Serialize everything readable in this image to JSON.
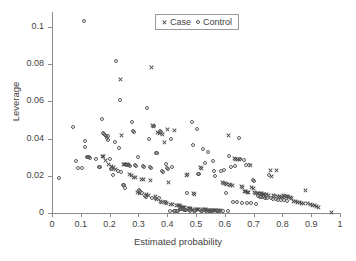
{
  "chart_data": {
    "type": "scatter",
    "title": "",
    "xlabel": "Estimated probability",
    "ylabel": "Leverage",
    "xlim": [
      0,
      1
    ],
    "ylim": [
      0,
      0.108
    ],
    "grid": false,
    "legend_position": "top-center",
    "xticks": [
      0,
      0.1,
      0.2,
      0.3,
      0.4,
      0.5,
      0.6,
      0.7,
      0.8,
      0.9,
      1
    ],
    "xticklabels": [
      "0",
      "0.1",
      "0.2",
      "0.3",
      "0.4",
      "0.5",
      "0.6",
      "0.7",
      "0.8",
      "0.9",
      "1"
    ],
    "yticks": [
      0,
      0.02,
      0.04,
      0.06,
      0.08,
      0.1
    ],
    "yticklabels": [
      "0",
      "0.02",
      "0.04",
      "0.06",
      "0.08",
      "0.1"
    ],
    "series": [
      {
        "name": "Case",
        "marker": "x",
        "color": "#4a4a4a",
        "points": [
          [
            0.175,
            0.0305
          ],
          [
            0.178,
            0.0302
          ],
          [
            0.186,
            0.0283
          ],
          [
            0.196,
            0.0263
          ],
          [
            0.205,
            0.025
          ],
          [
            0.213,
            0.0243
          ],
          [
            0.222,
            0.0233
          ],
          [
            0.238,
            0.072
          ],
          [
            0.24,
            0.0418
          ],
          [
            0.247,
            0.0262
          ],
          [
            0.252,
            0.026
          ],
          [
            0.258,
            0.0258
          ],
          [
            0.262,
            0.0258
          ],
          [
            0.268,
            0.0207
          ],
          [
            0.276,
            0.02
          ],
          [
            0.283,
            0.0193
          ],
          [
            0.289,
            0.019
          ],
          [
            0.296,
            0.011
          ],
          [
            0.303,
            0.0104
          ],
          [
            0.311,
            0.0182
          ],
          [
            0.318,
            0.0178
          ],
          [
            0.327,
            0.0102
          ],
          [
            0.334,
            0.0095
          ],
          [
            0.341,
            0.0175
          ],
          [
            0.345,
            0.0781
          ],
          [
            0.349,
            0.047
          ],
          [
            0.352,
            0.0466
          ],
          [
            0.358,
            0.0088
          ],
          [
            0.363,
            0.007
          ],
          [
            0.368,
            0.0432
          ],
          [
            0.372,
            0.0427
          ],
          [
            0.376,
            0.0064
          ],
          [
            0.381,
            0.0058
          ],
          [
            0.385,
            0.042
          ],
          [
            0.39,
            0.038
          ],
          [
            0.395,
            0.0054
          ],
          [
            0.398,
            0.005
          ],
          [
            0.402,
            0.0451
          ],
          [
            0.405,
            0.0164
          ],
          [
            0.412,
            0.0048
          ],
          [
            0.418,
            0.0045
          ],
          [
            0.424,
            0.0443
          ],
          [
            0.432,
            0.0042
          ],
          [
            0.438,
            0.004
          ],
          [
            0.443,
            0.0038
          ],
          [
            0.447,
            0.0035
          ],
          [
            0.452,
            0.0032
          ],
          [
            0.456,
            0.003
          ],
          [
            0.461,
            0.0028
          ],
          [
            0.466,
            0.0203
          ],
          [
            0.47,
            0.0205
          ],
          [
            0.474,
            0.0026
          ],
          [
            0.478,
            0.0024
          ],
          [
            0.482,
            0.0022
          ],
          [
            0.487,
            0.0021
          ],
          [
            0.492,
            0.0103
          ],
          [
            0.496,
            0.0098
          ],
          [
            0.501,
            0.002
          ],
          [
            0.505,
            0.0019
          ],
          [
            0.51,
            0.0018
          ],
          [
            0.515,
            0.0245
          ],
          [
            0.52,
            0.024
          ],
          [
            0.524,
            0.0018
          ],
          [
            0.529,
            0.0017
          ],
          [
            0.534,
            0.0017
          ],
          [
            0.538,
            0.0016
          ],
          [
            0.542,
            0.0016
          ],
          [
            0.547,
            0.0015
          ],
          [
            0.551,
            0.0015
          ],
          [
            0.555,
            0.0014
          ],
          [
            0.559,
            0.0014
          ],
          [
            0.563,
            0.0014
          ],
          [
            0.567,
            0.0013
          ],
          [
            0.572,
            0.0013
          ],
          [
            0.578,
            0.0013
          ],
          [
            0.585,
            0.0012
          ],
          [
            0.592,
            0.0165
          ],
          [
            0.597,
            0.016
          ],
          [
            0.602,
            0.0157
          ],
          [
            0.607,
            0.0155
          ],
          [
            0.612,
            0.0418
          ],
          [
            0.616,
            0.0152
          ],
          [
            0.621,
            0.015
          ],
          [
            0.626,
            0.0148
          ],
          [
            0.632,
            0.0295
          ],
          [
            0.638,
            0.029
          ],
          [
            0.644,
            0.0288
          ],
          [
            0.651,
            0.0285
          ],
          [
            0.657,
            0.014
          ],
          [
            0.663,
            0.0138
          ],
          [
            0.668,
            0.0115
          ],
          [
            0.673,
            0.0113
          ],
          [
            0.678,
            0.0112
          ],
          [
            0.683,
            0.011
          ],
          [
            0.688,
            0.0255
          ],
          [
            0.693,
            0.0135
          ],
          [
            0.698,
            0.0132
          ],
          [
            0.703,
            0.0108
          ],
          [
            0.708,
            0.0107
          ],
          [
            0.713,
            0.0106
          ],
          [
            0.718,
            0.0105
          ],
          [
            0.723,
            0.0104
          ],
          [
            0.728,
            0.0103
          ],
          [
            0.733,
            0.0102
          ],
          [
            0.738,
            0.01
          ],
          [
            0.744,
            0.0098
          ],
          [
            0.752,
            0.0095
          ],
          [
            0.758,
            0.023
          ],
          [
            0.763,
            0.0195
          ],
          [
            0.768,
            0.0092
          ],
          [
            0.774,
            0.009
          ],
          [
            0.779,
            0.023
          ],
          [
            0.784,
            0.0088
          ],
          [
            0.789,
            0.0086
          ],
          [
            0.794,
            0.0084
          ],
          [
            0.799,
            0.0082
          ],
          [
            0.804,
            0.0092
          ],
          [
            0.809,
            0.009
          ],
          [
            0.814,
            0.0088
          ],
          [
            0.818,
            0.0086
          ],
          [
            0.822,
            0.0084
          ],
          [
            0.827,
            0.0082
          ],
          [
            0.831,
            0.008
          ],
          [
            0.838,
            0.0062
          ],
          [
            0.844,
            0.006
          ],
          [
            0.851,
            0.0058
          ],
          [
            0.858,
            0.0055
          ],
          [
            0.866,
            0.0053
          ],
          [
            0.873,
            0.0052
          ],
          [
            0.88,
            0.012
          ],
          [
            0.888,
            0.005
          ],
          [
            0.896,
            0.0048
          ],
          [
            0.903,
            0.004
          ],
          [
            0.911,
            0.0038
          ],
          [
            0.918,
            0.0034
          ],
          [
            0.925,
            0.003
          ],
          [
            0.972,
            0.0005
          ]
        ]
      },
      {
        "name": "Control",
        "marker": "o",
        "color": "#5a5a5a",
        "points": [
          [
            0.025,
            0.0188
          ],
          [
            0.072,
            0.046
          ],
          [
            0.083,
            0.028
          ],
          [
            0.091,
            0.0243
          ],
          [
            0.105,
            0.024
          ],
          [
            0.11,
            0.103
          ],
          [
            0.113,
            0.0385
          ],
          [
            0.116,
            0.0355
          ],
          [
            0.121,
            0.0302
          ],
          [
            0.124,
            0.03
          ],
          [
            0.128,
            0.0302
          ],
          [
            0.133,
            0.0296
          ],
          [
            0.152,
            0.0288
          ],
          [
            0.163,
            0.0248
          ],
          [
            0.168,
            0.0245
          ],
          [
            0.172,
            0.0504
          ],
          [
            0.176,
            0.0432
          ],
          [
            0.18,
            0.0425
          ],
          [
            0.183,
            0.0418
          ],
          [
            0.186,
            0.0415
          ],
          [
            0.19,
            0.0405
          ],
          [
            0.193,
            0.0412
          ],
          [
            0.196,
            0.0393
          ],
          [
            0.2,
            0.029
          ],
          [
            0.204,
            0.0239
          ],
          [
            0.209,
            0.0236
          ],
          [
            0.213,
            0.0203
          ],
          [
            0.218,
            0.0382
          ],
          [
            0.223,
            0.0815
          ],
          [
            0.228,
            0.0228
          ],
          [
            0.232,
            0.035
          ],
          [
            0.237,
            0.0605
          ],
          [
            0.241,
            0.0222
          ],
          [
            0.246,
            0.0153
          ],
          [
            0.25,
            0.0148
          ],
          [
            0.255,
            0.0135
          ],
          [
            0.259,
            0.026
          ],
          [
            0.264,
            0.0258
          ],
          [
            0.268,
            0.0256
          ],
          [
            0.272,
            0.0254
          ],
          [
            0.277,
            0.0487
          ],
          [
            0.281,
            0.044
          ],
          [
            0.285,
            0.0435
          ],
          [
            0.289,
            0.0256
          ],
          [
            0.293,
            0.0254
          ],
          [
            0.297,
            0.0303
          ],
          [
            0.302,
            0.0125
          ],
          [
            0.306,
            0.012
          ],
          [
            0.311,
            0.011
          ],
          [
            0.315,
            0.025
          ],
          [
            0.319,
            0.0248
          ],
          [
            0.323,
            0.009
          ],
          [
            0.327,
            0.0086
          ],
          [
            0.331,
            0.0563
          ],
          [
            0.336,
            0.0395
          ],
          [
            0.34,
            0.0245
          ],
          [
            0.344,
            0.024
          ],
          [
            0.348,
            0.0082
          ],
          [
            0.353,
            0.0468
          ],
          [
            0.357,
            0.008
          ],
          [
            0.361,
            0.0325
          ],
          [
            0.366,
            0.0322
          ],
          [
            0.37,
            0.0078
          ],
          [
            0.374,
            0.044
          ],
          [
            0.378,
            0.0435
          ],
          [
            0.383,
            0.0225
          ],
          [
            0.387,
            0.0222
          ],
          [
            0.391,
            0.006
          ],
          [
            0.396,
            0.0262
          ],
          [
            0.4,
            0.024
          ],
          [
            0.404,
            0.0238
          ],
          [
            0.409,
            0.0013
          ],
          [
            0.413,
            0.04
          ],
          [
            0.418,
            0.0245
          ],
          [
            0.422,
            0.0012
          ],
          [
            0.428,
            0.0011
          ],
          [
            0.433,
            0.001
          ],
          [
            0.438,
            0.001
          ],
          [
            0.443,
            0.0022
          ],
          [
            0.448,
            0.002
          ],
          [
            0.452,
            0.0019
          ],
          [
            0.457,
            0.0018
          ],
          [
            0.461,
            0.0016
          ],
          [
            0.466,
            0.0015
          ],
          [
            0.47,
            0.0105
          ],
          [
            0.475,
            0.0014
          ],
          [
            0.48,
            0.0013
          ],
          [
            0.485,
            0.0488
          ],
          [
            0.489,
            0.0365
          ],
          [
            0.494,
            0.0012
          ],
          [
            0.498,
            0.0011
          ],
          [
            0.503,
            0.0452
          ],
          [
            0.508,
            0.021
          ],
          [
            0.512,
            0.0207
          ],
          [
            0.517,
            0.001
          ],
          [
            0.521,
            0.001
          ],
          [
            0.526,
            0.0345
          ],
          [
            0.531,
            0.0268
          ],
          [
            0.535,
            0.001
          ],
          [
            0.54,
            0.033
          ],
          [
            0.545,
            0.001
          ],
          [
            0.549,
            0.001
          ],
          [
            0.554,
            0.001
          ],
          [
            0.558,
            0.0278
          ],
          [
            0.563,
            0.0225
          ],
          [
            0.567,
            0.02
          ],
          [
            0.572,
            0.001
          ],
          [
            0.577,
            0.001
          ],
          [
            0.582,
            0.001
          ],
          [
            0.588,
            0.0228
          ],
          [
            0.593,
            0.001
          ],
          [
            0.598,
            0.0232
          ],
          [
            0.604,
            0.011
          ],
          [
            0.61,
            0.001
          ],
          [
            0.616,
            0.0305
          ],
          [
            0.622,
            0.0248
          ],
          [
            0.628,
            0.006
          ],
          [
            0.634,
            0.025
          ],
          [
            0.641,
            0.0058
          ],
          [
            0.648,
            0.0403
          ],
          [
            0.654,
            0.029
          ],
          [
            0.66,
            0.0055
          ],
          [
            0.666,
            0.0285
          ],
          [
            0.672,
            0.026
          ],
          [
            0.678,
            0.0053
          ],
          [
            0.684,
            0.0257
          ],
          [
            0.69,
            0.0052
          ],
          [
            0.697,
            0.0175
          ],
          [
            0.703,
            0.0172
          ],
          [
            0.709,
            0.005
          ],
          [
            0.715,
            0.009
          ],
          [
            0.721,
            0.0088
          ],
          [
            0.727,
            0.0086
          ],
          [
            0.733,
            0.0084
          ],
          [
            0.74,
            0.0082
          ],
          [
            0.747,
            0.008
          ],
          [
            0.754,
            0.0205
          ],
          [
            0.761,
            0.0078
          ],
          [
            0.769,
            0.0076
          ],
          [
            0.777,
            0.0074
          ],
          [
            0.786,
            0.0072
          ],
          [
            0.795,
            0.007
          ],
          [
            0.806,
            0.0068
          ],
          [
            0.816,
            0.0066
          ]
        ]
      }
    ]
  },
  "legend": {
    "entries": [
      {
        "label": "Case",
        "marker": "x-marker"
      },
      {
        "label": "Control",
        "marker": "circle-marker"
      }
    ]
  },
  "axes": {
    "x": {
      "label": "Estimated probability",
      "ticklabels": [
        "0",
        "0.1",
        "0.2",
        "0.3",
        "0.4",
        "0.5",
        "0.6",
        "0.7",
        "0.8",
        "0.9",
        "1"
      ]
    },
    "y": {
      "label": "Leverage",
      "ticklabels": [
        "0",
        "0.02",
        "0.04",
        "0.06",
        "0.08",
        "0.1"
      ]
    }
  },
  "colors": {
    "axis": "#8c8c8c",
    "text": "#3f3f3f",
    "case_marker": "#4a4a4a",
    "control_marker": "#5a5a5a",
    "background": "#ffffff"
  }
}
